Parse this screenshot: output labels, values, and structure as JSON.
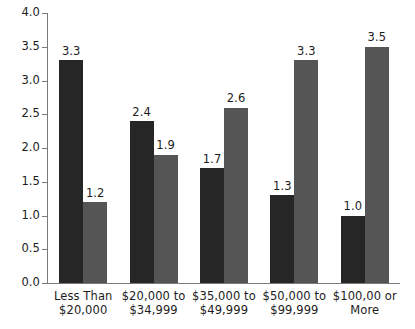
{
  "chart_data": {
    "type": "bar",
    "title": "",
    "subtitle": "",
    "xlabel": "",
    "ylabel": "",
    "ylim": [
      0.0,
      4.0
    ],
    "ytick_step": 0.5,
    "ytick_labels": [
      "0.0",
      "0.5",
      "1.0",
      "1.5",
      "2.0",
      "2.5",
      "3.0",
      "3.5",
      "4.0"
    ],
    "ytick_values": [
      0.0,
      0.5,
      1.0,
      1.5,
      2.0,
      2.5,
      3.0,
      3.5,
      4.0
    ],
    "grid": false,
    "legend": false,
    "legend_position": "none",
    "grouped": true,
    "categories": [
      "Less Than $20,000",
      "$20,000 to $34,999",
      "$35,000 to $49,999",
      "$50,000 to $99,999",
      "$100,00 or More"
    ],
    "category_lines": [
      [
        "Less Than",
        "$20,000"
      ],
      [
        "$20,000 to",
        "$34,999"
      ],
      [
        "$35,000 to",
        "$49,999"
      ],
      [
        "$50,000 to",
        "$99,999"
      ],
      [
        "$100,00 or",
        "More"
      ]
    ],
    "series": [
      {
        "name": "series-1",
        "color": "#262626",
        "values": [
          3.3,
          2.4,
          1.7,
          1.3,
          1.0
        ],
        "labels": [
          "3.3",
          "2.4",
          "1.7",
          "1.3",
          "1.0"
        ]
      },
      {
        "name": "series-2",
        "color": "#555555",
        "values": [
          1.2,
          1.9,
          2.6,
          3.3,
          3.5
        ],
        "labels": [
          "1.2",
          "1.9",
          "2.6",
          "3.3",
          "3.5"
        ]
      }
    ]
  },
  "colors": {
    "background": "#ffffff",
    "axis": "#7a7a7a",
    "text": "#1c1c1c",
    "series_dark": "#262626",
    "series_gray": "#555555"
  }
}
